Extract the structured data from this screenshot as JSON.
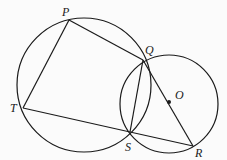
{
  "diagram": {
    "points": {
      "P": {
        "label": "P",
        "x": 69,
        "y": 20,
        "lx": 62,
        "ly": 16
      },
      "Q": {
        "label": "Q",
        "x": 143,
        "y": 60,
        "lx": 145,
        "ly": 54
      },
      "T": {
        "label": "T",
        "x": 23,
        "y": 108,
        "lx": 10,
        "ly": 112
      },
      "S": {
        "label": "S",
        "x": 130,
        "y": 132,
        "lx": 125,
        "ly": 151
      },
      "R": {
        "label": "R",
        "x": 193,
        "y": 146,
        "lx": 195,
        "ly": 157
      },
      "O": {
        "label": "O",
        "x": 169,
        "y": 102,
        "lx": 175,
        "ly": 99
      }
    },
    "circles": [
      {
        "name": "circle-PQST",
        "cx": 84,
        "cy": 85,
        "r": 67
      },
      {
        "name": "circle-O",
        "cx": 169,
        "cy": 104,
        "r": 49
      }
    ],
    "segments": [
      [
        "P",
        "Q"
      ],
      [
        "P",
        "T"
      ],
      [
        "T",
        "S"
      ],
      [
        "S",
        "R"
      ],
      [
        "Q",
        "R"
      ],
      [
        "Q",
        "S"
      ]
    ]
  }
}
